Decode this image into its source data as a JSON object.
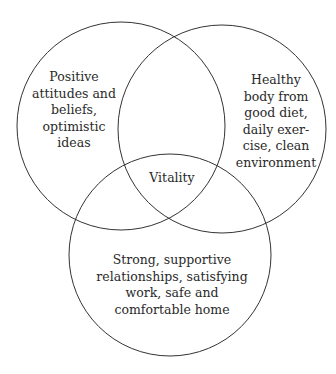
{
  "diagram": {
    "type": "venn",
    "stroke_color": "#333333",
    "circles": [
      {
        "id": "mind",
        "label": "Positive\nattitudes and\nbeliefs,\noptimistic\nideas"
      },
      {
        "id": "body",
        "label": "Healthy\nbody from\ngood diet,\ndaily exer-\ncise, clean\nenvironment"
      },
      {
        "id": "life",
        "label": "Strong, supportive\nrelationships, satisfying\nwork, safe and\ncomfortable home"
      }
    ],
    "center_label": "Vitality"
  }
}
